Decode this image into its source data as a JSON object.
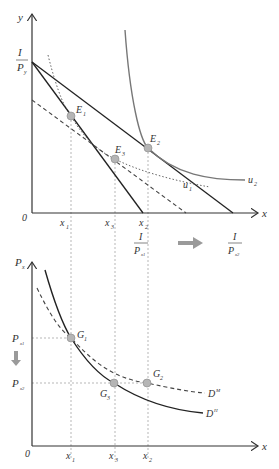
{
  "top_panel": {
    "y_axis_label": "y",
    "x_axis_label": "x",
    "origin_label": "0",
    "intercept_y": {
      "num": "I",
      "den": "P",
      "den_sub": "y"
    },
    "x_ticks": [
      {
        "main": "x",
        "sub": "1"
      },
      {
        "main": "x",
        "sub": "3"
      },
      {
        "main": "x",
        "sub": "2"
      }
    ],
    "x_intercept_before": {
      "num": "I",
      "den": "P",
      "den_sub": "x1"
    },
    "x_intercept_after": {
      "num": "I",
      "den": "P",
      "den_sub": "x2"
    },
    "points": [
      {
        "main": "E",
        "sub": "1"
      },
      {
        "main": "E",
        "sub": "3"
      },
      {
        "main": "E",
        "sub": "2"
      }
    ],
    "curves": [
      {
        "main": "u",
        "sub": "1"
      },
      {
        "main": "u",
        "sub": "2"
      }
    ]
  },
  "bottom_panel": {
    "y_axis_label": {
      "main": "P",
      "sub": "x"
    },
    "x_axis_label": "x",
    "origin_label": "0",
    "y_ticks": [
      {
        "main": "P",
        "sub": "x1"
      },
      {
        "main": "P",
        "sub": "x2"
      }
    ],
    "x_ticks": [
      {
        "main": "x",
        "sub": "1"
      },
      {
        "main": "x",
        "sub": "3"
      },
      {
        "main": "x",
        "sub": "2"
      }
    ],
    "points": [
      {
        "main": "G",
        "sub": "1"
      },
      {
        "main": "G",
        "sub": "3"
      },
      {
        "main": "G",
        "sub": "2"
      }
    ],
    "curves": [
      {
        "main": "D",
        "sub": "M"
      },
      {
        "main": "D",
        "sub": "H"
      }
    ]
  },
  "colors": {
    "axis": "#333333",
    "line": "#222222",
    "curve_gray": "#777777",
    "point_fill": "#b5b5b5",
    "guide": "#999999",
    "arrow": "#9a9a9a"
  }
}
